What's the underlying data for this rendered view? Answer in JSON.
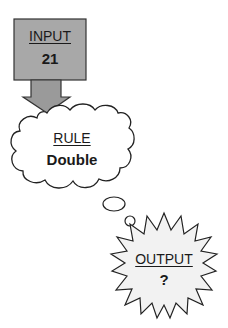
{
  "diagram": {
    "type": "function-machine",
    "input": {
      "heading": "INPUT",
      "value": "21",
      "shape": "rectangle",
      "fill": "#a8a8a8"
    },
    "arrow": {
      "direction": "down",
      "fill": "#9a9a9a"
    },
    "rule": {
      "heading": "RULE",
      "value": "Double",
      "shape": "cloud",
      "fill": "#ffffff"
    },
    "connector": {
      "shape": "thought-bubbles",
      "count": 2
    },
    "output": {
      "heading": "OUTPUT",
      "value": "?",
      "shape": "starburst",
      "fill": "#f2f2f2"
    },
    "colors": {
      "stroke": "#222222",
      "text": "#1a1a1a"
    }
  }
}
